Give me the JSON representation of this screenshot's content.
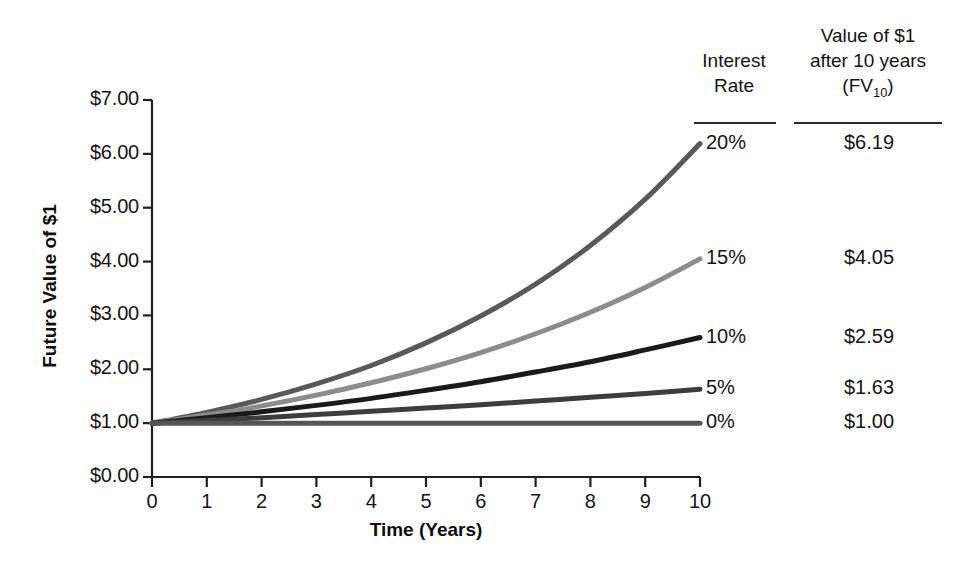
{
  "chart_data": {
    "type": "line",
    "title": "",
    "xlabel": "Time (Years)",
    "ylabel": "Future Value of $1",
    "xlim": [
      0,
      10
    ],
    "ylim": [
      0,
      7
    ],
    "grid": false,
    "legend_position": "right",
    "x": [
      0,
      1,
      2,
      3,
      4,
      5,
      6,
      7,
      8,
      9,
      10
    ],
    "x_tick_labels": [
      "0",
      "1",
      "2",
      "3",
      "4",
      "5",
      "6",
      "7",
      "8",
      "9",
      "10"
    ],
    "y_tick_values": [
      0,
      1,
      2,
      3,
      4,
      5,
      6,
      7
    ],
    "y_tick_labels": [
      "$0.00",
      "$1.00",
      "$2.00",
      "$3.00",
      "$4.00",
      "$5.00",
      "$6.00",
      "$7.00"
    ],
    "series": [
      {
        "name": "20%",
        "rate": 0.2,
        "color": "#595959",
        "fv10": "$6.19",
        "values": [
          1.0,
          1.2,
          1.44,
          1.73,
          2.07,
          2.49,
          2.99,
          3.58,
          4.3,
          5.16,
          6.19
        ]
      },
      {
        "name": "15%",
        "rate": 0.15,
        "color": "#8c8c8c",
        "fv10": "$4.05",
        "values": [
          1.0,
          1.15,
          1.32,
          1.52,
          1.75,
          2.01,
          2.31,
          2.66,
          3.06,
          3.52,
          4.05
        ]
      },
      {
        "name": "10%",
        "rate": 0.1,
        "color": "#1a1a1a",
        "fv10": "$2.59",
        "values": [
          1.0,
          1.1,
          1.21,
          1.33,
          1.46,
          1.61,
          1.77,
          1.95,
          2.14,
          2.36,
          2.59
        ]
      },
      {
        "name": "5%",
        "rate": 0.05,
        "color": "#3d3d3d",
        "fv10": "$1.63",
        "values": [
          1.0,
          1.05,
          1.1,
          1.16,
          1.22,
          1.28,
          1.34,
          1.41,
          1.48,
          1.55,
          1.63
        ]
      },
      {
        "name": "0%",
        "rate": 0.0,
        "color": "#555555",
        "fv10": "$1.00",
        "values": [
          1.0,
          1.0,
          1.0,
          1.0,
          1.0,
          1.0,
          1.0,
          1.0,
          1.0,
          1.0,
          1.0
        ]
      }
    ]
  },
  "legend_table": {
    "header_col1": "Interest\nRate",
    "header_col1_line1": "Interest",
    "header_col1_line2": "Rate",
    "header_col2_line1": "Value of $1",
    "header_col2_line2": "after 10 years",
    "header_col2_line3_pre": "(FV",
    "header_col2_line3_sub": "10",
    "header_col2_line3_post": ")",
    "rows": [
      {
        "rate": "20%",
        "value": "$6.19"
      },
      {
        "rate": "15%",
        "value": "$4.05"
      },
      {
        "rate": "10%",
        "value": "$2.59"
      },
      {
        "rate": "5%",
        "value": "$1.63"
      },
      {
        "rate": "0%",
        "value": "$1.00"
      }
    ]
  },
  "colors": {
    "axis": "#1f1f1f",
    "text": "#141414",
    "background": "#ffffff"
  }
}
